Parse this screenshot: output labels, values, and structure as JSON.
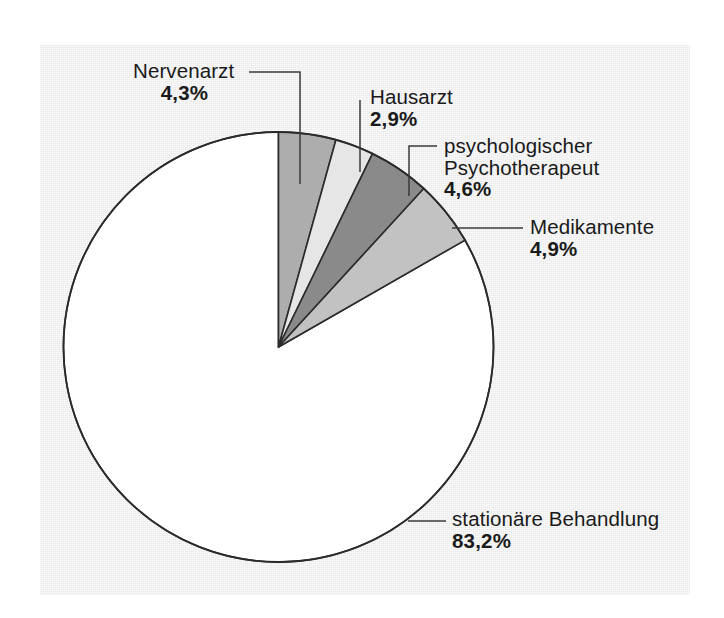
{
  "figure": {
    "background_color": "#ffffff",
    "panel_color": "#e9e9e9",
    "outline_color": "#2b2b2b"
  },
  "chart_data": {
    "type": "pie",
    "title": "",
    "subtitle": "",
    "xlabel": "",
    "ylabel": "",
    "grid": false,
    "legend_position": "none",
    "label_format": "German decimal comma with percent sign",
    "units": "%",
    "start_angle_deg": 0,
    "direction": "clockwise",
    "categories": [
      "Nervenarzt",
      "Hausarzt",
      "psychologischer Psychotherapeut",
      "Medikamente",
      "stationäre Behandlung"
    ],
    "values": [
      4.3,
      2.9,
      4.6,
      4.9,
      83.2
    ],
    "value_labels": [
      "4,3%",
      "2,9%",
      "4,6%",
      "4,9%",
      "83,2%"
    ],
    "colors": [
      "#adadad",
      "#e6e6e6",
      "#8a8a8a",
      "#c2c2c2",
      "#ffffff"
    ],
    "slices": [
      {
        "label": "Nervenarzt",
        "label_line1": "Nervenarzt",
        "label_line2": "",
        "value": 4.3,
        "value_label": "4,3%",
        "color": "#adadad"
      },
      {
        "label": "Hausarzt",
        "label_line1": "Hausarzt",
        "label_line2": "",
        "value": 2.9,
        "value_label": "2,9%",
        "color": "#e6e6e6"
      },
      {
        "label": "psychologischer Psychotherapeut",
        "label_line1": "psychologischer",
        "label_line2": "Psychotherapeut",
        "value": 4.6,
        "value_label": "4,6%",
        "color": "#8a8a8a"
      },
      {
        "label": "Medikamente",
        "label_line1": "Medikamente",
        "label_line2": "",
        "value": 4.9,
        "value_label": "4,9%",
        "color": "#c2c2c2"
      },
      {
        "label": "stationäre Behandlung",
        "label_line1": "stationäre Behandlung",
        "label_line2": "",
        "value": 83.2,
        "value_label": "83,2%",
        "color": "#ffffff"
      }
    ]
  }
}
